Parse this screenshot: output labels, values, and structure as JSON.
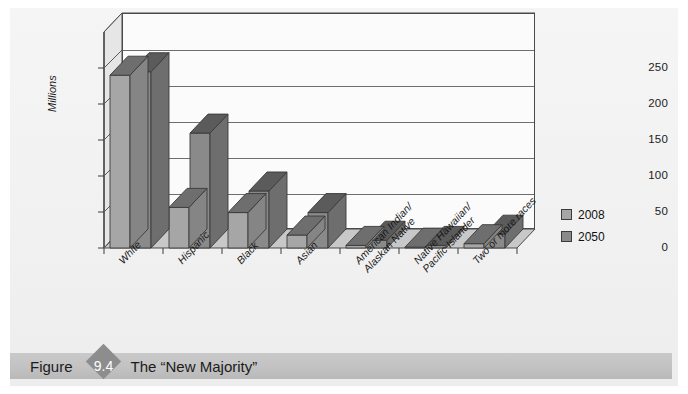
{
  "figure": {
    "label_word": "Figure",
    "number": "9.4",
    "title": "The “New Majority”"
  },
  "colors": {
    "page_background": "#f3f3f3",
    "plot_background": "#fbfbfb",
    "floor": "#c8c8c8",
    "wall_side": "#e2e2e2",
    "series_2008": "#a6a6a6",
    "series_2050": "#8a8a8a",
    "axis": "#4a4a4a",
    "gridline": "#6e6e6e",
    "caption_bar": "#c2c2c2",
    "caption_diamond": "#8d8d8d",
    "text": "#1b1b1b"
  },
  "chart_data": {
    "type": "bar",
    "title": "The “New Majority”",
    "xlabel": "",
    "ylabel": "Millions",
    "ylim": [
      0,
      250
    ],
    "yticks": [
      0,
      50,
      100,
      150,
      200,
      250
    ],
    "ytick_labels": [
      "0",
      "50",
      "100",
      "150",
      "200",
      "250"
    ],
    "grid": true,
    "legend_position": "right",
    "three_d": true,
    "categories": [
      "White",
      "Hispanic",
      "Black",
      "Asian",
      "American Indian/\nAlaskan Native",
      "Native Hawaiian/\nPacific Islander",
      "Two or more races"
    ],
    "series": [
      {
        "name": "2008",
        "values": [
          200,
          47,
          41,
          15,
          3,
          1,
          5
        ]
      },
      {
        "name": "2050",
        "values": [
          204,
          133,
          66,
          41,
          9,
          3,
          16
        ]
      }
    ]
  },
  "legend": {
    "items": [
      {
        "label": "2008",
        "color": "#a6a6a6"
      },
      {
        "label": "2050",
        "color": "#8a8a8a"
      }
    ]
  },
  "axis": {
    "y_title": "Millions"
  }
}
